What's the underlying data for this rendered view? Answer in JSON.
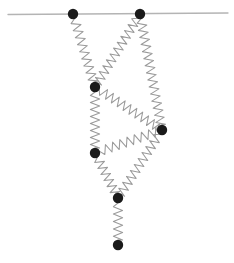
{
  "figure": {
    "background_color": "#ffffff",
    "width": 234,
    "height": 263
  },
  "ceiling": {
    "label": "ceiling-support-line",
    "x1": 8,
    "y1": 14.5,
    "x2": 228,
    "y2": 13.0,
    "color": "#b4b4b4",
    "stroke_width": 1.3
  },
  "node_style": {
    "color": "#1a1a1a",
    "radius": 5.2
  },
  "spring_style": {
    "color": "#9a9a9a",
    "stroke_width": 1.05,
    "amplitude": 4.6,
    "coil_length": 7.2
  },
  "nodes": [
    {
      "id": "a1",
      "label": "anchor-left",
      "x": 73,
      "y": 14,
      "fixed": true
    },
    {
      "id": "a2",
      "label": "anchor-right",
      "x": 140,
      "y": 14,
      "fixed": true
    },
    {
      "id": "n1",
      "label": "joint-upper-left",
      "x": 95,
      "y": 87,
      "fixed": false
    },
    {
      "id": "n2",
      "label": "joint-right",
      "x": 162,
      "y": 130,
      "fixed": false
    },
    {
      "id": "n3",
      "label": "joint-lower-left",
      "x": 95,
      "y": 153,
      "fixed": false
    },
    {
      "id": "n4",
      "label": "joint-lower",
      "x": 118,
      "y": 198,
      "fixed": false
    },
    {
      "id": "n5",
      "label": "free-end-mass",
      "x": 118,
      "y": 245,
      "fixed": false
    }
  ],
  "springs": [
    {
      "id": "s1",
      "label": "spring-anchor-left-to-upper-left",
      "from": "a1",
      "to": "n1"
    },
    {
      "id": "s2",
      "label": "spring-anchor-right-to-upper-left",
      "from": "a2",
      "to": "n1"
    },
    {
      "id": "s3",
      "label": "spring-anchor-right-to-right",
      "from": "a2",
      "to": "n2"
    },
    {
      "id": "s4",
      "label": "spring-upper-left-to-right",
      "from": "n1",
      "to": "n2"
    },
    {
      "id": "s5",
      "label": "spring-upper-left-to-lower-left",
      "from": "n1",
      "to": "n3"
    },
    {
      "id": "s6",
      "label": "spring-lower-left-to-right",
      "from": "n3",
      "to": "n2"
    },
    {
      "id": "s7",
      "label": "spring-lower-left-to-lower",
      "from": "n3",
      "to": "n4"
    },
    {
      "id": "s8",
      "label": "spring-right-to-lower",
      "from": "n2",
      "to": "n4"
    },
    {
      "id": "s9",
      "label": "spring-lower-to-free-end",
      "from": "n4",
      "to": "n5"
    }
  ]
}
